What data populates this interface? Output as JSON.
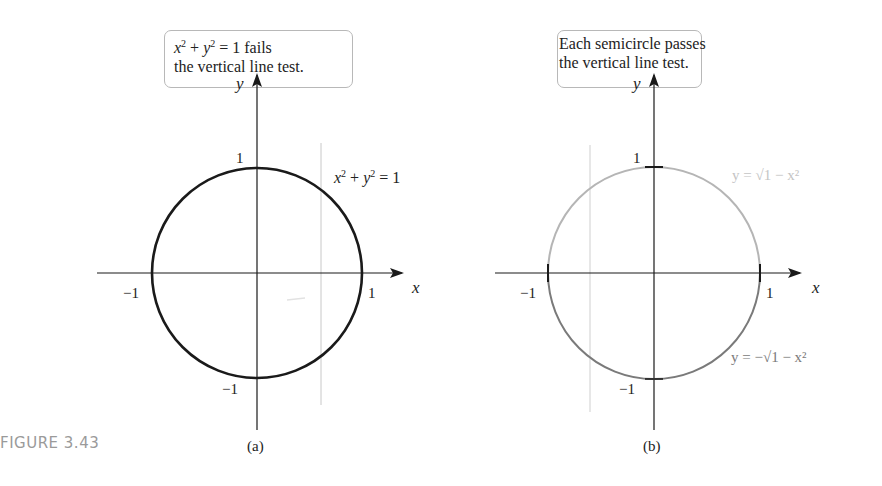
{
  "figure": {
    "label": "FIGURE 3.43"
  },
  "panels": [
    {
      "id": "a",
      "caption": "(a)",
      "callout": {
        "line1_prefix": "x",
        "line1_sup1": "2",
        "line1_mid": " + ",
        "line1_y": "y",
        "line1_sup2": "2",
        "line1_suffix": " = 1 fails",
        "line2": "the vertical line test."
      },
      "curve_label": "x² + y² = 1",
      "axis_labels": {
        "x": "x",
        "y": "y"
      },
      "ticks": {
        "x_neg": "−1",
        "x_pos": "1",
        "y_pos": "1",
        "y_neg": "−1"
      },
      "curve_color": "#1a1a1a"
    },
    {
      "id": "b",
      "caption": "(b)",
      "callout": {
        "line1": "Each semicircle passes",
        "line2": "the vertical line test."
      },
      "upper_label": "y = √1 − x²",
      "lower_label": "y = −√1 − x²",
      "axis_labels": {
        "x": "x",
        "y": "y"
      },
      "ticks": {
        "x_neg": "−1",
        "x_pos": "1",
        "y_pos": "1",
        "y_neg": "−1"
      },
      "upper_color": "#b5b5b5",
      "lower_color": "#7a7a7a"
    }
  ]
}
